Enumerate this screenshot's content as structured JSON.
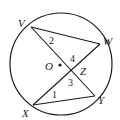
{
  "diagram": {
    "type": "circle-geometry",
    "circle": {
      "center_label": "O",
      "cx": 61,
      "cy": 64,
      "r": 51
    },
    "points": {
      "V": {
        "x": 31,
        "y": 27,
        "label": "V"
      },
      "W": {
        "x": 100,
        "y": 44,
        "label": "W"
      },
      "X": {
        "x": 33,
        "y": 105,
        "label": "X"
      },
      "Y": {
        "x": 95,
        "y": 96,
        "label": "Y"
      },
      "Z": {
        "x": 72,
        "y": 70,
        "label": "Z"
      },
      "O": {
        "x": 60,
        "y": 65,
        "label": "O"
      }
    },
    "segments": [
      [
        "V",
        "Y"
      ],
      [
        "X",
        "W"
      ],
      [
        "V",
        "W"
      ],
      [
        "X",
        "Y"
      ]
    ],
    "angle_labels": {
      "a1": "1",
      "a2": "2",
      "a3": "3",
      "a4": "4"
    }
  }
}
